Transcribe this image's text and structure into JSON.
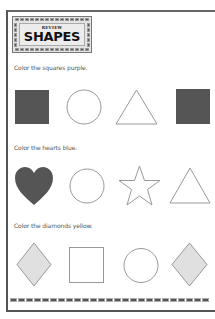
{
  "header": {
    "subtitle": "REVIEW",
    "title": "SHAPES"
  },
  "sections": [
    {
      "instruction": "Color the squares purple.",
      "shapes": [
        "square-filled",
        "circle",
        "triangle",
        "square-filled"
      ]
    },
    {
      "instruction": "Color the hearts blue.",
      "shapes": [
        "heart-filled",
        "circle",
        "star",
        "triangle"
      ]
    },
    {
      "instruction": "Color the diamonds yellow.",
      "shapes": [
        "diamond-shaded",
        "square",
        "circle",
        "diamond-shaded"
      ]
    }
  ],
  "colors": {
    "filled": "#555555",
    "shaded": "#e0e0e0",
    "outline": "#999999",
    "border": "#555555"
  }
}
